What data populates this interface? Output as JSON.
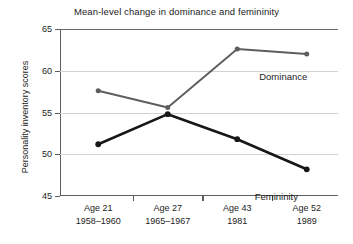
{
  "chart_data": {
    "type": "line",
    "title": "Mean-level change in dominance and femininity",
    "xlabel": "",
    "ylabel": "Personality inventory scores",
    "categories": [
      "Age 21",
      "Age 27",
      "Age 43",
      "Age 52"
    ],
    "category_sublabels": [
      "1958–1960",
      "1965–1967",
      "1981",
      "1989"
    ],
    "ylim": [
      45,
      65
    ],
    "yticks": [
      45,
      50,
      55,
      60,
      65
    ],
    "ytick_labels": [
      "45",
      "50",
      "55",
      "60",
      "65"
    ],
    "grid": "horizontal",
    "legend_position": "inline-annotations",
    "series": [
      {
        "name": "Dominance",
        "color": "#5e5e5e",
        "values": [
          57.6,
          55.6,
          62.6,
          62.0
        ]
      },
      {
        "name": "Femininity",
        "color": "#171717",
        "values": [
          51.2,
          54.8,
          51.8,
          48.2
        ]
      }
    ],
    "annotations": [
      {
        "text": "Dominance",
        "series": "Dominance"
      },
      {
        "text": "Femininity",
        "series": "Femininity"
      }
    ]
  }
}
